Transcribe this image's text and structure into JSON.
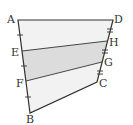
{
  "figure": {
    "type": "quadrilateral-trapezoid-division",
    "points": {
      "A": [
        18,
        20
      ],
      "D": [
        113,
        20
      ],
      "H": [
        107,
        41
      ],
      "G": [
        102,
        62
      ],
      "C": [
        97,
        82
      ],
      "B": [
        30,
        113
      ],
      "E": [
        22,
        51
      ],
      "F": [
        26,
        81
      ]
    },
    "labels": {
      "A": "A",
      "B": "B",
      "C": "C",
      "D": "D",
      "E": "E",
      "F": "F",
      "G": "G",
      "H": "H"
    },
    "colors": {
      "stroke": "#333333",
      "light_fill": "#f2f2f2",
      "shaded_fill": "#dcdcdc"
    }
  }
}
